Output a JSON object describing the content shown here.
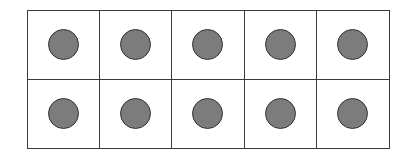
{
  "diagram": {
    "type": "ten-frame",
    "rows": 2,
    "columns": 5,
    "filled_count": 10,
    "colors": {
      "counter_fill": "#7c7c7c",
      "counter_stroke": "#333333",
      "grid_line": "#3a3a3a",
      "background": "#ffffff"
    },
    "cells": [
      {
        "row": 1,
        "col": 1,
        "filled": true
      },
      {
        "row": 1,
        "col": 2,
        "filled": true
      },
      {
        "row": 1,
        "col": 3,
        "filled": true
      },
      {
        "row": 1,
        "col": 4,
        "filled": true
      },
      {
        "row": 1,
        "col": 5,
        "filled": true
      },
      {
        "row": 2,
        "col": 1,
        "filled": true
      },
      {
        "row": 2,
        "col": 2,
        "filled": true
      },
      {
        "row": 2,
        "col": 3,
        "filled": true
      },
      {
        "row": 2,
        "col": 4,
        "filled": true
      },
      {
        "row": 2,
        "col": 5,
        "filled": true
      }
    ]
  }
}
